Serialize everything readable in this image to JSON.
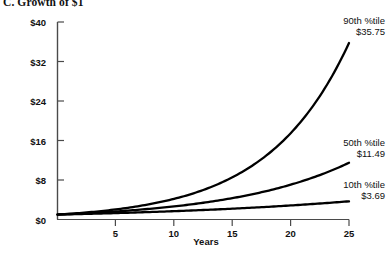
{
  "chart_data": {
    "type": "line",
    "title": "C. Growth of $1",
    "xlabel": "Years",
    "ylabel": "",
    "xlim": [
      0,
      25
    ],
    "ylim": [
      0,
      40
    ],
    "grid": false,
    "legend_position": "inline-annotations",
    "x_ticks": [
      5,
      10,
      15,
      20,
      25
    ],
    "x_tick_labels": [
      "5",
      "10",
      "15",
      "20",
      "25"
    ],
    "y_ticks": [
      0,
      8,
      16,
      24,
      32,
      40
    ],
    "y_tick_labels": [
      "$0",
      "$8",
      "$16",
      "$24",
      "$32",
      "$40"
    ],
    "x": [
      0,
      1,
      2,
      3,
      4,
      5,
      6,
      7,
      8,
      9,
      10,
      11,
      12,
      13,
      14,
      15,
      16,
      17,
      18,
      19,
      20,
      21,
      22,
      23,
      24,
      25
    ],
    "series": [
      {
        "name": "90th %tile",
        "end_label": "$35.75",
        "end_value": 35.75,
        "color": "#000000",
        "values": [
          1.0,
          1.165,
          1.357,
          1.581,
          1.842,
          2.146,
          2.5,
          2.913,
          3.394,
          3.954,
          4.606,
          5.366,
          6.252,
          7.283,
          8.485,
          9.886,
          11.518,
          13.419,
          15.634,
          18.214,
          21.22,
          24.722,
          28.802,
          33.555,
          39.094,
          35.75
        ],
        "annotation": {
          "name": "90th %tile",
          "value": "$35.75"
        }
      },
      {
        "name": "50th %tile",
        "end_label": "$11.49",
        "end_value": 11.49,
        "color": "#000000",
        "values": [
          1.0,
          1.102,
          1.215,
          1.339,
          1.476,
          1.627,
          1.793,
          1.976,
          2.178,
          2.401,
          2.646,
          2.917,
          3.215,
          3.543,
          3.905,
          4.304,
          4.744,
          5.229,
          5.763,
          6.352,
          7.0,
          7.715,
          8.503,
          9.372,
          10.33,
          11.49
        ],
        "annotation": {
          "name": "50th %tile",
          "value": "$11.49"
        }
      },
      {
        "name": "10th %tile",
        "end_label": "$3.69",
        "end_value": 3.69,
        "color": "#000000",
        "values": [
          1.0,
          1.0536,
          1.11,
          1.17,
          1.2326,
          1.2987,
          1.3683,
          1.4416,
          1.5189,
          1.6003,
          1.686,
          1.7764,
          1.8716,
          1.972,
          2.0777,
          2.1891,
          2.3064,
          2.43,
          2.5603,
          2.6975,
          2.842,
          2.9943,
          3.1548,
          3.3239,
          3.502,
          3.69
        ],
        "annotation": {
          "name": "10th %tile",
          "value": "$3.69"
        }
      }
    ]
  },
  "title": {
    "text": "C. Growth of $1"
  },
  "axes": {
    "x_title": "Years"
  }
}
